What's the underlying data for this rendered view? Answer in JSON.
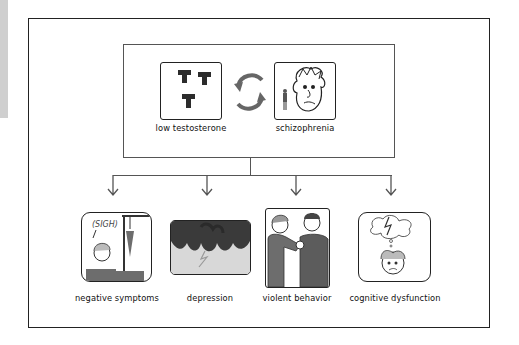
{
  "diagram": {
    "top": {
      "cause": {
        "label": "low testosterone",
        "icon": "testosterone-molecules-icon"
      },
      "cycle_icon": "bidirectional-cycle-arrows-icon",
      "condition": {
        "label": "schizophrenia",
        "icon": "confused-face-icon"
      }
    },
    "outcomes": [
      {
        "label": "negative symptoms",
        "icon": "sighing-person-icon",
        "speech": "(SIGH)"
      },
      {
        "label": "depression",
        "icon": "storm-cloud-icon"
      },
      {
        "label": "violent behavior",
        "icon": "two-men-fighting-icon"
      },
      {
        "label": "cognitive dysfunction",
        "icon": "thought-storm-head-icon"
      }
    ],
    "colors": {
      "border": "#222222",
      "connector": "#555555",
      "icon_dark": "#333333",
      "icon_gray": "#6d6d6d",
      "strip": "#cfcfcf"
    }
  }
}
